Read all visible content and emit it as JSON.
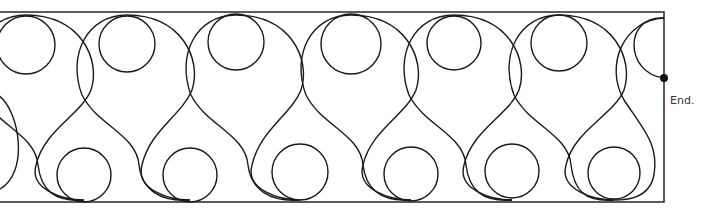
{
  "diagram": {
    "type": "quilting-pattern",
    "stroke_color": "#1a1a1a",
    "end_label": "End.",
    "border": {
      "x": -2,
      "y": 12,
      "width": 666,
      "height": 190
    },
    "end_point": {
      "x": 664,
      "y": 78
    },
    "top_circles": [
      {
        "cx": 26,
        "cy": 45,
        "r": 29
      },
      {
        "cx": 127,
        "cy": 44,
        "r": 28
      },
      {
        "cx": 236,
        "cy": 42,
        "r": 28
      },
      {
        "cx": 351,
        "cy": 44,
        "r": 30
      },
      {
        "cx": 454,
        "cy": 43,
        "r": 27
      },
      {
        "cx": 559,
        "cy": 43,
        "r": 28
      }
    ],
    "bottom_circles": [
      {
        "cx": 84,
        "cy": 175,
        "r": 27
      },
      {
        "cx": 190,
        "cy": 175,
        "r": 27
      },
      {
        "cx": 300,
        "cy": 172,
        "r": 28
      },
      {
        "cx": 411,
        "cy": 174,
        "r": 27
      },
      {
        "cx": 512,
        "cy": 171,
        "r": 27
      },
      {
        "cx": 614,
        "cy": 173,
        "r": 26
      }
    ],
    "loops": [
      {
        "top_x": 26,
        "bottom_x": 84
      },
      {
        "top_x": 127,
        "bottom_x": 190
      },
      {
        "top_x": 236,
        "bottom_x": 300
      },
      {
        "top_x": 351,
        "bottom_x": 411
      },
      {
        "top_x": 454,
        "bottom_x": 512
      },
      {
        "top_x": 559,
        "bottom_x": 614
      }
    ]
  }
}
